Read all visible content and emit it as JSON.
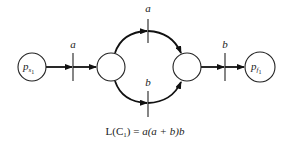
{
  "diagram": {
    "type": "petri-net",
    "places": [
      {
        "id": "p_s1",
        "label_main": "p",
        "label_sub": "s",
        "label_subsub": "1"
      },
      {
        "id": "p_mid_left",
        "label_main": ""
      },
      {
        "id": "p_mid_right",
        "label_main": ""
      },
      {
        "id": "p_f1",
        "label_main": "p",
        "label_sub": "f",
        "label_subsub": "1"
      }
    ],
    "transitions": [
      {
        "id": "t_in",
        "label": "a"
      },
      {
        "id": "t_upper",
        "label": "a"
      },
      {
        "id": "t_lower",
        "label": "b"
      },
      {
        "id": "t_out",
        "label": "b"
      }
    ],
    "edges": [
      [
        "p_s1",
        "t_in"
      ],
      [
        "t_in",
        "p_mid_left"
      ],
      [
        "p_mid_left",
        "t_upper"
      ],
      [
        "t_upper",
        "p_mid_right"
      ],
      [
        "p_mid_left",
        "t_lower"
      ],
      [
        "t_lower",
        "p_mid_right"
      ],
      [
        "p_mid_right",
        "t_out"
      ],
      [
        "t_out",
        "p_f1"
      ]
    ]
  },
  "equation": {
    "lhs_main": "L(C",
    "lhs_sub": "1",
    "lhs_close": ") = ",
    "rhs": "a(a + b)b"
  }
}
